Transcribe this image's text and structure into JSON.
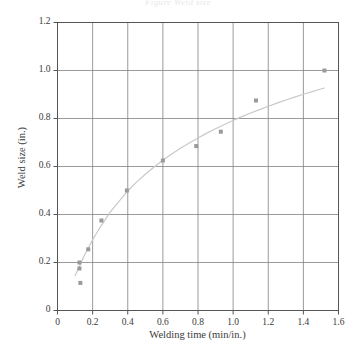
{
  "figure": {
    "header_text": "Figure  Weld size",
    "background": "#ffffff",
    "width": 356,
    "height": 354
  },
  "chart_data": {
    "type": "scatter",
    "title": "",
    "subtitle": "",
    "xlabel": "Welding time (min/in.)",
    "ylabel": "Weld size (in.)",
    "xlim": [
      0,
      1.6
    ],
    "ylim": [
      0,
      1.2
    ],
    "xticks": [
      0,
      0.2,
      0.4,
      0.6,
      0.8,
      1.0,
      1.2,
      1.4,
      1.6
    ],
    "xtick_labels": [
      "0",
      "0.2",
      "0.4",
      "0.6",
      "0.8",
      "1.0",
      "1.2",
      "1.4",
      "1.6"
    ],
    "yticks": [
      0,
      0.2,
      0.4,
      0.6,
      0.8,
      1.0,
      1.2
    ],
    "ytick_labels": [
      "0",
      "0.2",
      "0.4",
      "0.6",
      "0.8",
      "1.0",
      "1.2"
    ],
    "grid": true,
    "grid_color": "#808080",
    "axis_color": "#555555",
    "legend": null,
    "legend_position": "none",
    "marker_color": "#9a9a9a",
    "marker_shape": "square",
    "marker_size": 4,
    "curve_color": "#c9c9c9",
    "curve_width": 1.2,
    "points": [
      {
        "x": 0.125,
        "y": 0.2
      },
      {
        "x": 0.125,
        "y": 0.175
      },
      {
        "x": 0.13,
        "y": 0.115
      },
      {
        "x": 0.175,
        "y": 0.255
      },
      {
        "x": 0.25,
        "y": 0.375
      },
      {
        "x": 0.395,
        "y": 0.5
      },
      {
        "x": 0.6,
        "y": 0.625
      },
      {
        "x": 0.79,
        "y": 0.685
      },
      {
        "x": 0.93,
        "y": 0.745
      },
      {
        "x": 1.13,
        "y": 0.875
      },
      {
        "x": 1.52,
        "y": 1.0
      }
    ],
    "fit_curve": {
      "name": "fitted trend",
      "x": [
        0.1,
        0.15,
        0.2,
        0.25,
        0.3,
        0.35,
        0.4,
        0.45,
        0.5,
        0.55,
        0.6,
        0.65,
        0.7,
        0.75,
        0.8,
        0.85,
        0.9,
        0.95,
        1.0,
        1.05,
        1.1,
        1.15,
        1.2,
        1.25,
        1.3,
        1.35,
        1.4,
        1.45,
        1.5,
        1.52
      ],
      "y": [
        0.145,
        0.225,
        0.295,
        0.355,
        0.41,
        0.455,
        0.498,
        0.535,
        0.568,
        0.598,
        0.626,
        0.652,
        0.676,
        0.698,
        0.719,
        0.739,
        0.757,
        0.775,
        0.792,
        0.808,
        0.823,
        0.837,
        0.851,
        0.864,
        0.877,
        0.889,
        0.901,
        0.912,
        0.923,
        0.927
      ]
    }
  }
}
